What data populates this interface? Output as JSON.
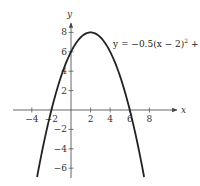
{
  "chart_data": {
    "type": "line",
    "title": "",
    "xlabel": "x",
    "ylabel": "y",
    "xlim": [
      -5.9,
      10.9
    ],
    "ylim": [
      -7,
      8.9
    ],
    "grid": false,
    "x_ticks": [
      -4,
      -2,
      2,
      4,
      6,
      8
    ],
    "x_tick_labels": [
      "−4",
      "−2",
      "2",
      "4",
      "6",
      "8"
    ],
    "y_ticks": [
      -6,
      -4,
      -2,
      2,
      4,
      6,
      8
    ],
    "y_tick_labels": [
      "−6",
      "−4",
      "−2",
      "2",
      "4",
      "6",
      "8"
    ],
    "series": [
      {
        "name": "y = −0.5(x − 2)² + 8",
        "equation": "y = -0.5(x - 2)^2 + 8",
        "x_range": [
          -3.46,
          7.46
        ],
        "vertex": [
          2,
          8
        ],
        "x_intercepts": [
          -2,
          6
        ],
        "y_intercept": 6,
        "points": [
          {
            "x": -3.46,
            "y": -6.9
          },
          {
            "x": -2,
            "y": 0
          },
          {
            "x": 0,
            "y": 6
          },
          {
            "x": 2,
            "y": 8
          },
          {
            "x": 4,
            "y": 6
          },
          {
            "x": 6,
            "y": 0
          },
          {
            "x": 7.46,
            "y": -6.9
          }
        ],
        "color": "#222222"
      }
    ],
    "annotations": [
      {
        "text": "y = −0.5(x − 2)² + 8",
        "position": "upper right of vertex"
      }
    ]
  },
  "labels": {
    "x_axis": "x",
    "y_axis": "y",
    "equation": {
      "prefix": "y = −0.5(x − 2)",
      "exponent": "2",
      "suffix": " + 8"
    }
  },
  "colors": {
    "curve": "#222222",
    "axis": "#444444",
    "text": "#333333",
    "background": "#ffffff"
  }
}
